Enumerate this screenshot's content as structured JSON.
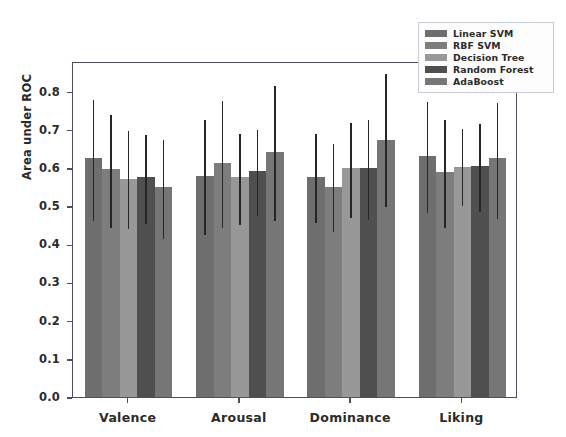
{
  "chart_data": {
    "type": "bar",
    "title": "",
    "xlabel": "",
    "ylabel": "Area under ROC",
    "ylim": [
      0.0,
      0.88
    ],
    "yticks": [
      "0.0",
      "0.1",
      "0.2",
      "0.3",
      "0.4",
      "0.5",
      "0.6",
      "0.7",
      "0.8"
    ],
    "ytick_values": [
      0.0,
      0.1,
      0.2,
      0.3,
      0.4,
      0.5,
      0.6,
      0.7,
      0.8
    ],
    "grid": false,
    "legend_position": "upper right",
    "categories": [
      "Valence",
      "Arousal",
      "Dominance",
      "Liking"
    ],
    "series": [
      {
        "name": "Linear SVM",
        "color": "#6e6e6e",
        "values": [
          0.625,
          0.58,
          0.575,
          0.63
        ],
        "err_low": [
          0.465,
          0.43,
          0.46,
          0.487
        ],
        "err_high": [
          0.782,
          0.732,
          0.695,
          0.778
        ]
      },
      {
        "name": "RBF SVM",
        "color": "#7d7d7d",
        "values": [
          0.598,
          0.612,
          0.55,
          0.59
        ],
        "err_low": [
          0.447,
          0.447,
          0.437,
          0.447
        ],
        "err_high": [
          0.745,
          0.78,
          0.667,
          0.732
        ]
      },
      {
        "name": "Decision Tree",
        "color": "#989898",
        "values": [
          0.572,
          0.575,
          0.6,
          0.602
        ],
        "err_low": [
          0.445,
          0.455,
          0.475,
          0.505
        ],
        "err_high": [
          0.703,
          0.695,
          0.723,
          0.708
        ]
      },
      {
        "name": "Random Forest",
        "color": "#4f4f4f",
        "values": [
          0.575,
          0.592,
          0.6,
          0.605
        ],
        "err_low": [
          0.458,
          0.478,
          0.47,
          0.49
        ],
        "err_high": [
          0.692,
          0.705,
          0.73,
          0.72
        ]
      },
      {
        "name": "AdaBoost",
        "color": "#767676",
        "values": [
          0.55,
          0.643,
          0.672,
          0.625
        ],
        "err_low": [
          0.418,
          0.465,
          0.502,
          0.472
        ],
        "err_high": [
          0.678,
          0.82,
          0.85,
          0.775
        ]
      }
    ]
  },
  "legend": {
    "items": [
      {
        "label": "Linear SVM"
      },
      {
        "label": "RBF SVM"
      },
      {
        "label": "Decision Tree"
      },
      {
        "label": "Random Forest"
      },
      {
        "label": "AdaBoost"
      }
    ]
  }
}
